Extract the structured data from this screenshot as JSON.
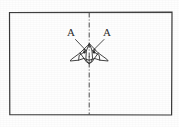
{
  "figure": {
    "background_color": "#fefefe",
    "ink_color": "#2b2b2b",
    "frame": {
      "name": "outer-rectangle",
      "x": 9,
      "y": 12,
      "width": 163,
      "height": 103,
      "stroke_width": 1.1
    },
    "centerline": {
      "name": "vertical-dash-dot-centerline",
      "x": 89,
      "y_top": 12,
      "y_bottom": 115,
      "pattern": "dash-dot",
      "dash_array": "5,2,1,2"
    },
    "labels": [
      {
        "id": "label-a-left",
        "text": "A",
        "x": 71,
        "y": 36,
        "leader_from_x": 75,
        "leader_from_y": 39,
        "leader_to_x": 85,
        "leader_to_y": 50
      },
      {
        "id": "label-a-right",
        "text": "A",
        "x": 104,
        "y": 36,
        "leader_from_x": 104,
        "leader_from_y": 39,
        "leader_to_x": 94,
        "leader_to_y": 50
      }
    ],
    "aircraft": {
      "name": "swept-wing-aircraft-plan-view",
      "center_x": 89,
      "nose_y": 44,
      "tail_y": 63,
      "span_left_x": 70,
      "span_right_x": 108,
      "description": "delta / swept wing aircraft seen from above, straddling the centerline"
    }
  }
}
